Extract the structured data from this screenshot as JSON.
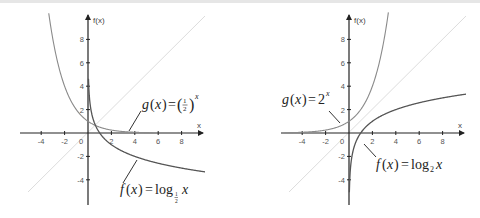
{
  "chart_data": [
    {
      "type": "line",
      "title": "",
      "xlabel": "x",
      "ylabel": "f(x)",
      "xlim": [
        -5.5,
        10
      ],
      "ylim": [
        -6,
        10
      ],
      "x_ticks": [
        "-4",
        "-2",
        "0",
        "2",
        "4",
        "6",
        "8"
      ],
      "y_ticks": [
        "8",
        "6",
        "4",
        "2",
        "-2",
        "-4"
      ],
      "grid": false,
      "series": [
        {
          "name": "g(x) = (1/2)^x",
          "color": "#8a8a8a",
          "x": [
            -3.4,
            -3,
            -2,
            -1,
            0,
            1,
            2,
            3,
            4,
            5
          ],
          "values": [
            10.6,
            8,
            4,
            2,
            1,
            0.5,
            0.25,
            0.125,
            0.0625,
            0.03
          ]
        },
        {
          "name": "f(x) = log_1/2 x",
          "color": "#555555",
          "x": [
            0.05,
            0.1,
            0.25,
            0.5,
            1,
            2,
            4,
            6,
            8,
            10
          ],
          "values": [
            4.32,
            3.32,
            2,
            1,
            0,
            -1,
            -2,
            -2.58,
            -3,
            -3.32
          ]
        },
        {
          "name": "y = x",
          "color": "#dddddd",
          "x": [
            -5,
            9.5
          ],
          "values": [
            -5,
            9.5
          ]
        }
      ],
      "annotations": [
        {
          "text": "g(x) = (1/2)^x",
          "points_to": [
            3.5,
            0.09
          ]
        },
        {
          "text": "f(x) = log_1/2 x",
          "points_to": [
            4.2,
            -2.1
          ]
        }
      ]
    },
    {
      "type": "line",
      "title": "",
      "xlabel": "x",
      "ylabel": "f(x)",
      "xlim": [
        -5.5,
        10
      ],
      "ylim": [
        -6,
        10
      ],
      "x_ticks": [
        "-4",
        "-2",
        "0",
        "2",
        "4",
        "6",
        "8"
      ],
      "y_ticks": [
        "8",
        "6",
        "4",
        "2",
        "-2",
        "-4"
      ],
      "grid": false,
      "series": [
        {
          "name": "g(x) = 2^x",
          "color": "#8a8a8a",
          "x": [
            -5,
            -4,
            -3,
            -2,
            -1,
            0,
            1,
            2,
            3,
            3.4
          ],
          "values": [
            0.03,
            0.0625,
            0.125,
            0.25,
            0.5,
            1,
            2,
            4,
            8,
            10.6
          ]
        },
        {
          "name": "f(x) = log_2 x",
          "color": "#555555",
          "x": [
            0.05,
            0.1,
            0.25,
            0.5,
            1,
            2,
            4,
            6,
            8,
            10
          ],
          "values": [
            -4.32,
            -3.32,
            -2,
            -1,
            0,
            1,
            2,
            2.58,
            3,
            3.32
          ]
        },
        {
          "name": "y = x",
          "color": "#dddddd",
          "x": [
            -5,
            9.5
          ],
          "values": [
            -5,
            9.5
          ]
        }
      ],
      "annotations": [
        {
          "text": "g(x) = 2^x",
          "points_to": [
            -0.8,
            0.6
          ]
        },
        {
          "text": "f(x) = log_2 x",
          "points_to": [
            1.3,
            -0.4
          ]
        }
      ]
    }
  ],
  "left": {
    "y_axis_label": "f(x)",
    "x_axis_label": "x",
    "x_ticks": [
      "-4",
      "-2",
      "0",
      "2",
      "4",
      "6",
      "8"
    ],
    "y_ticks": [
      "8",
      "6",
      "4",
      "2",
      "-2",
      "-4"
    ],
    "g_label": {
      "lhs": "g",
      "var": "x",
      "eq": "=",
      "base_num": "1",
      "base_den": "2",
      "exp": "x"
    },
    "f_label": {
      "lhs": "f",
      "var": "x",
      "eq": "=",
      "fn": "log",
      "sub_num": "1",
      "sub_den": "2",
      "arg": "x"
    }
  },
  "right": {
    "y_axis_label": "f(x)",
    "x_axis_label": "x",
    "x_ticks": [
      "-4",
      "-2",
      "0",
      "2",
      "4",
      "6",
      "8"
    ],
    "y_ticks": [
      "8",
      "6",
      "4",
      "2",
      "-2",
      "-4"
    ],
    "g_label": {
      "lhs": "g",
      "var": "x",
      "eq": "=",
      "base": "2",
      "exp": "x"
    },
    "f_label": {
      "lhs": "f",
      "var": "x",
      "eq": "=",
      "fn": "log",
      "sub": "2",
      "arg": "x"
    }
  },
  "colors": {
    "axis": "#222222",
    "exp_curve": "#8a8a8a",
    "log_curve": "#555555",
    "identity_line": "#dddddd",
    "text": "#555555"
  }
}
